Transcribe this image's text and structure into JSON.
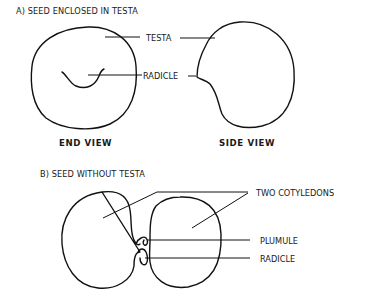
{
  "section_a": {
    "title": "A) SEED ENCLOSED IN TESTA",
    "labels": {
      "testa": "TESTA",
      "radicle": "RADICLE"
    },
    "captions": {
      "end_view": "END VIEW",
      "side_view": "SIDE VIEW"
    }
  },
  "section_b": {
    "title": "B) SEED WITHOUT TESTA",
    "labels": {
      "two_cotyledons": "TWO COTYLEDONS",
      "plumule": "PLUMULE",
      "radicle": "RADICLE"
    }
  },
  "colors": {
    "ink": "#111111",
    "background": "#ffffff"
  }
}
